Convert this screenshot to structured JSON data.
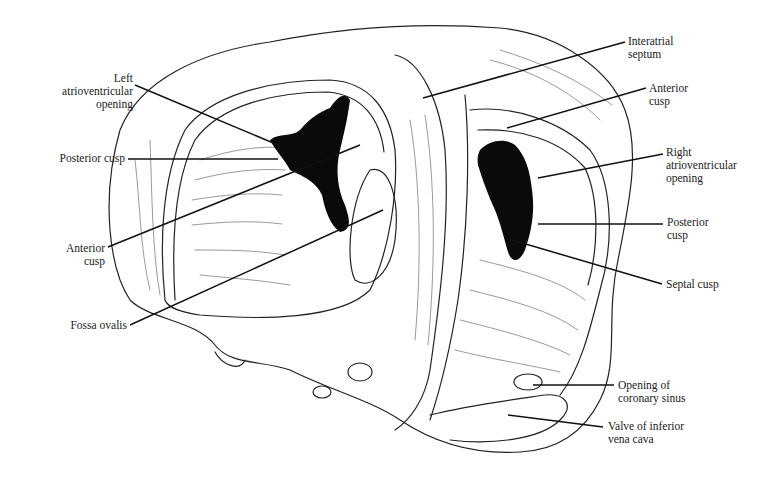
{
  "figure": {
    "ink_color": "#111111",
    "background_color": "#ffffff",
    "labels": {
      "left_av_opening": [
        "Left",
        "atrioventricular",
        "opening"
      ],
      "posterior_cusp_left": [
        "Posterior cusp"
      ],
      "anterior_cusp_left": [
        "Anterior",
        "cusp"
      ],
      "fossa_ovalis": [
        "Fossa ovalis"
      ],
      "interatrial_septum": [
        "Interatrial",
        "septum"
      ],
      "anterior_cusp_right": [
        "Anterior",
        "cusp"
      ],
      "right_av_opening": [
        "Right",
        "atrioventricular",
        "opening"
      ],
      "posterior_cusp_right": [
        "Posterior",
        "cusp"
      ],
      "septal_cusp": [
        "Septal cusp"
      ],
      "coronary_sinus_opening": [
        "Opening of",
        "coronary sinus"
      ],
      "ivc_valve": [
        "Valve of inferior",
        "vena cava"
      ]
    }
  }
}
